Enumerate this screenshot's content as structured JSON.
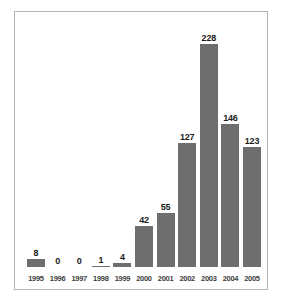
{
  "chart_data": {
    "type": "bar",
    "title": "",
    "subtitle": "",
    "xlabel": "",
    "ylabel": "",
    "categories": [
      "1995",
      "1996",
      "1997",
      "1998",
      "1999",
      "2000",
      "2001",
      "2002",
      "2003",
      "2004",
      "2005"
    ],
    "values": [
      8,
      0,
      0,
      1,
      4,
      42,
      55,
      127,
      228,
      146,
      123
    ],
    "value_labels": [
      "8",
      "0",
      "0",
      "1",
      "4",
      "42",
      "55",
      "127",
      "228",
      "146",
      "123"
    ],
    "ylim": [
      0,
      228
    ],
    "grid": false,
    "legend": null,
    "axis_visible": false,
    "bar_color": "#6e6e6e",
    "label_color": "#1a1a1a",
    "tick_label_color": "#3d3d3d",
    "frame_color": "#b3b3b3",
    "background_color": "#ffffff"
  }
}
